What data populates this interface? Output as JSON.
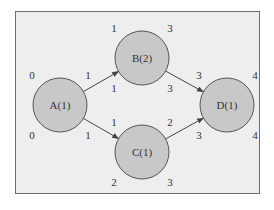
{
  "diagram": {
    "background": "#eeeeee",
    "node_fill": "#c8c8c8",
    "node_stroke": "#555555",
    "nodes": [
      {
        "id": "A",
        "label": "A(1)",
        "cx": 60,
        "cy": 105,
        "r": 27,
        "times": {
          "es": "0",
          "ef": "1",
          "ls": "0",
          "lf": "1"
        }
      },
      {
        "id": "B",
        "label": "B(2)",
        "cx": 142,
        "cy": 58,
        "r": 27,
        "times": {
          "es": "1",
          "ef": "3",
          "ls": "1",
          "lf": "3"
        }
      },
      {
        "id": "C",
        "label": "C(1)",
        "cx": 142,
        "cy": 152,
        "r": 27,
        "times": {
          "es": "1",
          "ef": "2",
          "ls": "2",
          "lf": "3"
        }
      },
      {
        "id": "D",
        "label": "D(1)",
        "cx": 227,
        "cy": 105,
        "r": 27,
        "times": {
          "es": "3",
          "ef": "4",
          "ls": "3",
          "lf": "4"
        }
      }
    ],
    "edges": [
      {
        "from": "A",
        "to": "B"
      },
      {
        "from": "A",
        "to": "C"
      },
      {
        "from": "B",
        "to": "D"
      },
      {
        "from": "C",
        "to": "D"
      }
    ]
  }
}
